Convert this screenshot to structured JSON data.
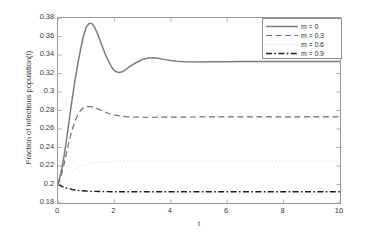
{
  "chart_data": {
    "type": "line",
    "title": "",
    "subtitle": "",
    "xlabel": "t",
    "ylabel": "Fraction of Infectious population(I)",
    "xlim": [
      0,
      10
    ],
    "ylim": [
      0.18,
      0.38
    ],
    "grid": false,
    "legend_position": "upper right",
    "xticks": [
      "0",
      "2",
      "4",
      "6",
      "8",
      "10"
    ],
    "xtick_values": [
      0,
      2,
      4,
      6,
      8,
      10
    ],
    "yticks": [
      "0.18",
      "0.2",
      "0.22",
      "0.24",
      "0.26",
      "0.28",
      "0.3",
      "0.32",
      "0.34",
      "0.36",
      "0.38"
    ],
    "ytick_values": [
      0.18,
      0.2,
      0.22,
      0.24,
      0.26,
      0.28,
      0.3,
      0.32,
      0.34,
      0.36,
      0.38
    ],
    "series": [
      {
        "name": "m = 0",
        "style": "solid",
        "color": "#7d7d7d",
        "width": 1.5,
        "x": [
          0,
          0.1,
          0.2,
          0.3,
          0.4,
          0.5,
          0.6,
          0.7,
          0.8,
          0.9,
          1.0,
          1.1,
          1.2,
          1.3,
          1.4,
          1.5,
          1.6,
          1.7,
          1.8,
          1.9,
          2.0,
          2.1,
          2.2,
          2.3,
          2.4,
          2.6,
          2.8,
          3.0,
          3.2,
          3.4,
          3.6,
          3.8,
          4.0,
          4.2,
          4.5,
          5.0,
          5.5,
          6.0,
          6.5,
          7.0,
          7.5,
          8.0,
          9.0,
          10.0
        ],
        "y": [
          0.2,
          0.212,
          0.228,
          0.248,
          0.27,
          0.292,
          0.312,
          0.33,
          0.346,
          0.36,
          0.37,
          0.374,
          0.374,
          0.37,
          0.363,
          0.355,
          0.347,
          0.339,
          0.333,
          0.327,
          0.323,
          0.3215,
          0.3212,
          0.3222,
          0.3243,
          0.3288,
          0.3322,
          0.3352,
          0.3368,
          0.337,
          0.3362,
          0.335,
          0.334,
          0.3332,
          0.3326,
          0.3324,
          0.3326,
          0.3328,
          0.3329,
          0.333,
          0.333,
          0.333,
          0.333,
          0.333
        ]
      },
      {
        "name": "m = 0.3",
        "style": "dashed",
        "color": "#6e6e6e",
        "width": 1.2,
        "x": [
          0,
          0.1,
          0.2,
          0.3,
          0.4,
          0.5,
          0.6,
          0.7,
          0.8,
          0.9,
          1.0,
          1.1,
          1.2,
          1.3,
          1.4,
          1.5,
          1.6,
          1.8,
          2.0,
          2.2,
          2.4,
          2.6,
          2.8,
          3.0,
          3.4,
          3.8,
          4.2,
          5.0,
          6.0,
          7.0,
          8.0,
          9.0,
          10.0
        ],
        "y": [
          0.2,
          0.208,
          0.22,
          0.234,
          0.248,
          0.259,
          0.268,
          0.275,
          0.28,
          0.283,
          0.284,
          0.2843,
          0.284,
          0.2832,
          0.282,
          0.2806,
          0.2792,
          0.2768,
          0.2752,
          0.274,
          0.2734,
          0.273,
          0.2728,
          0.2727,
          0.2727,
          0.2728,
          0.2729,
          0.273,
          0.273,
          0.273,
          0.273,
          0.273,
          0.273
        ]
      },
      {
        "name": "m = 0.6",
        "style": "dotted",
        "color": "#dadada",
        "width": 0.8,
        "x": [
          0,
          0.2,
          0.4,
          0.6,
          0.8,
          1.0,
          1.2,
          1.5,
          2.0,
          2.5,
          3.0,
          4.0,
          5.0,
          6.0,
          7.0,
          8.0,
          9.0,
          10.0
        ],
        "y": [
          0.2,
          0.206,
          0.2118,
          0.2162,
          0.2194,
          0.2216,
          0.223,
          0.2242,
          0.225,
          0.2252,
          0.2252,
          0.2252,
          0.2252,
          0.2252,
          0.2252,
          0.2252,
          0.2252,
          0.2252
        ]
      },
      {
        "name": "m = 0.9",
        "style": "dashdot",
        "color": "#1f1f1f",
        "width": 1.4,
        "x": [
          0,
          0.1,
          0.2,
          0.3,
          0.4,
          0.5,
          0.6,
          0.7,
          0.8,
          1.0,
          1.2,
          1.5,
          2.0,
          2.5,
          3.0,
          4.0,
          5.0,
          6.0,
          7.0,
          8.0,
          9.0,
          10.0
        ],
        "y": [
          0.2,
          0.1985,
          0.1972,
          0.1962,
          0.1953,
          0.1946,
          0.1941,
          0.1937,
          0.1934,
          0.1929,
          0.1926,
          0.1924,
          0.1922,
          0.1921,
          0.1921,
          0.1921,
          0.1921,
          0.1921,
          0.1921,
          0.1921,
          0.1921,
          0.1921
        ]
      }
    ]
  },
  "legend": {
    "entries": [
      {
        "label": "m = 0"
      },
      {
        "label": "m = 0.3"
      },
      {
        "label": "m = 0.6"
      },
      {
        "label": "m = 0.9"
      }
    ]
  }
}
